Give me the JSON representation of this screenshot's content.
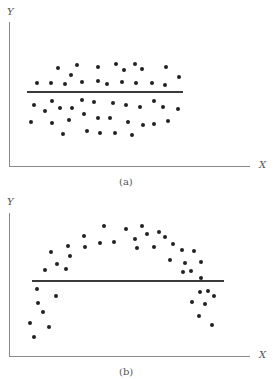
{
  "chart_data": [
    {
      "type": "scatter",
      "title": "(a)",
      "xlabel": "X",
      "ylabel": "Y",
      "grid": false,
      "reference_line": {
        "orientation": "horizontal",
        "y": 92,
        "x_start": 27,
        "x_end": 183
      },
      "points": [
        [
          37,
          83
        ],
        [
          51,
          83
        ],
        [
          65,
          84
        ],
        [
          82,
          82
        ],
        [
          98,
          81
        ],
        [
          107,
          84
        ],
        [
          122,
          82
        ],
        [
          136,
          83
        ],
        [
          152,
          83
        ],
        [
          165,
          85
        ],
        [
          58,
          68
        ],
        [
          71,
          75
        ],
        [
          77,
          65
        ],
        [
          98,
          67
        ],
        [
          116,
          64
        ],
        [
          124,
          70
        ],
        [
          135,
          64
        ],
        [
          142,
          69
        ],
        [
          166,
          67
        ],
        [
          179,
          77
        ],
        [
          34,
          105
        ],
        [
          45,
          111
        ],
        [
          52,
          101
        ],
        [
          60,
          108
        ],
        [
          72,
          108
        ],
        [
          82,
          100
        ],
        [
          94,
          102
        ],
        [
          113,
          103
        ],
        [
          126,
          105
        ],
        [
          140,
          107
        ],
        [
          154,
          101
        ],
        [
          163,
          107
        ],
        [
          178,
          109
        ],
        [
          31,
          122
        ],
        [
          52,
          123
        ],
        [
          69,
          120
        ],
        [
          84,
          114
        ],
        [
          98,
          118
        ],
        [
          110,
          118
        ],
        [
          128,
          122
        ],
        [
          143,
          125
        ],
        [
          154,
          124
        ],
        [
          168,
          121
        ],
        [
          63,
          134
        ],
        [
          87,
          131
        ],
        [
          100,
          133
        ],
        [
          115,
          133
        ],
        [
          132,
          135
        ]
      ]
    },
    {
      "type": "scatter",
      "title": "(b)",
      "xlabel": "X",
      "ylabel": "Y",
      "grid": false,
      "reference_line": {
        "orientation": "horizontal",
        "y": 281,
        "x_start": 32,
        "x_end": 224
      },
      "points": [
        [
          30,
          323
        ],
        [
          34,
          337
        ],
        [
          37,
          289
        ],
        [
          38,
          303
        ],
        [
          43,
          312
        ],
        [
          49,
          327
        ],
        [
          56,
          296
        ],
        [
          45,
          270
        ],
        [
          51,
          252
        ],
        [
          57,
          264
        ],
        [
          66,
          269
        ],
        [
          68,
          246
        ],
        [
          70,
          256
        ],
        [
          84,
          236
        ],
        [
          85,
          247
        ],
        [
          100,
          243
        ],
        [
          104,
          226
        ],
        [
          114,
          242
        ],
        [
          126,
          229
        ],
        [
          135,
          239
        ],
        [
          137,
          248
        ],
        [
          142,
          226
        ],
        [
          147,
          234
        ],
        [
          154,
          247
        ],
        [
          159,
          232
        ],
        [
          165,
          237
        ],
        [
          170,
          260
        ],
        [
          173,
          244
        ],
        [
          182,
          250
        ],
        [
          183,
          272
        ],
        [
          185,
          263
        ],
        [
          191,
          271
        ],
        [
          194,
          251
        ],
        [
          201,
          262
        ],
        [
          201,
          278
        ],
        [
          208,
          291
        ],
        [
          192,
          302
        ],
        [
          199,
          316
        ],
        [
          200,
          292
        ],
        [
          205,
          304
        ],
        [
          212,
          325
        ],
        [
          214,
          296
        ]
      ]
    }
  ],
  "panels": {
    "a": {
      "caption": "(a)",
      "xlabel": "X",
      "ylabel": "Y"
    },
    "b": {
      "caption": "(b)",
      "xlabel": "X",
      "ylabel": "Y"
    }
  }
}
